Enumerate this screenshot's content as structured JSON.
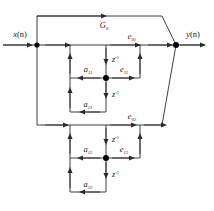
{
  "figure": {
    "type": "signal-flow-graph",
    "line_color": "#2b2b2b",
    "node_color": "#000000",
    "background": "#fefefe"
  },
  "labels": {
    "input": {
      "base": "x",
      "arg": "(n)"
    },
    "output": {
      "base": "y",
      "arg": "(n)"
    },
    "gain_g0": {
      "base": "G",
      "sub": "0"
    },
    "e01": {
      "base": "e",
      "sub": "01"
    },
    "e11": {
      "base": "e",
      "sub": "11"
    },
    "e02": {
      "base": "e",
      "sub": "02"
    },
    "e12": {
      "base": "e",
      "sub": "12"
    },
    "a11": {
      "base": "a",
      "sub": "11"
    },
    "a21": {
      "base": "a",
      "sub": "21"
    },
    "a12": {
      "base": "a",
      "sub": "12"
    },
    "a22": {
      "base": "a",
      "sub": "22"
    },
    "delay": {
      "base": "z",
      "sup": "-1"
    }
  },
  "delays": [
    {
      "id": "delay-1",
      "label_base": "z",
      "label_sup": "-1"
    },
    {
      "id": "delay-2",
      "label_base": "z",
      "label_sup": "-1"
    },
    {
      "id": "delay-3",
      "label_base": "z",
      "label_sup": "-1"
    },
    {
      "id": "delay-4",
      "label_base": "z",
      "label_sup": "-1"
    }
  ],
  "nodes": [
    {
      "id": "node-input-split",
      "x": 37,
      "y": 45
    },
    {
      "id": "node-output-sum",
      "x": 176,
      "y": 45
    },
    {
      "id": "node-stage1",
      "x": 106,
      "y": 78
    },
    {
      "id": "node-stage2",
      "x": 106,
      "y": 158
    }
  ],
  "branch_gains": [
    "a11",
    "a21",
    "a12",
    "a22"
  ],
  "forward_signals": [
    "e01",
    "e11",
    "e02",
    "e12"
  ]
}
